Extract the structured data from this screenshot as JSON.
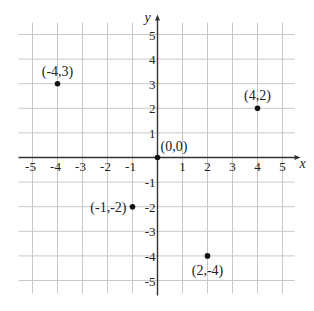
{
  "chart_data": {
    "type": "scatter",
    "title": "",
    "xlabel": "x",
    "ylabel": "y",
    "xlim": [
      -5,
      5
    ],
    "ylim": [
      -5,
      5
    ],
    "grid": true,
    "x_ticks": [
      -5,
      -4,
      -3,
      -2,
      -1,
      1,
      2,
      3,
      4,
      5
    ],
    "y_ticks": [
      -5,
      -4,
      -3,
      -2,
      -1,
      1,
      2,
      3,
      4,
      5
    ],
    "series": [
      {
        "name": "points",
        "points": [
          {
            "x": -4,
            "y": 3,
            "label": "(-4,3)",
            "label_pos": "above"
          },
          {
            "x": 4,
            "y": 2,
            "label": "(4,2)",
            "label_pos": "above"
          },
          {
            "x": 0,
            "y": 0,
            "label": "(0,0)",
            "label_pos": "above-right"
          },
          {
            "x": -1,
            "y": -2,
            "label": "(-1,-2)",
            "label_pos": "left"
          },
          {
            "x": 2,
            "y": -4,
            "label": "(2,-4)",
            "label_pos": "below"
          }
        ]
      }
    ]
  },
  "colors": {
    "grid": "#c8c8c8",
    "axis": "#333333",
    "point": "#111111",
    "text": "#222222"
  }
}
